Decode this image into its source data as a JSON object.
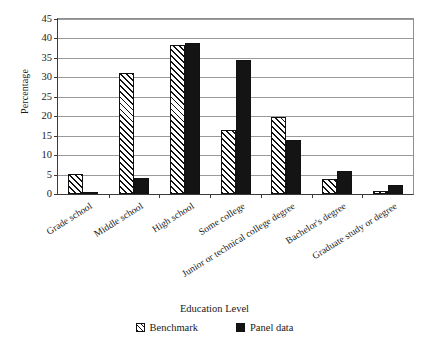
{
  "chart_data": {
    "type": "bar",
    "title": "",
    "xlabel": "Education Level",
    "ylabel": "Percentage",
    "ylim": [
      0,
      45
    ],
    "ytick_step": 5,
    "yticks": [
      0,
      5,
      10,
      15,
      20,
      25,
      30,
      35,
      40,
      45
    ],
    "grid": true,
    "legend_position": "bottom",
    "categories": [
      "Grade school",
      "Middle school",
      "High school",
      "Some college",
      "Junior or technical college degree",
      "Bachelor's degree",
      "Graduate study or degree"
    ],
    "series": [
      {
        "name": "Benchmark",
        "fill": "diagonal-hatch",
        "color": "#ffffff",
        "values": [
          5.2,
          31.0,
          38.3,
          16.5,
          19.8,
          3.8,
          0.8
        ]
      },
      {
        "name": "Panel data",
        "fill": "solid",
        "color": "#141414",
        "values": [
          0.2,
          4.0,
          38.8,
          34.5,
          14.0,
          6.0,
          2.2
        ]
      }
    ]
  },
  "legend": {
    "items": [
      {
        "label": "Benchmark"
      },
      {
        "label": "Panel data"
      }
    ]
  }
}
